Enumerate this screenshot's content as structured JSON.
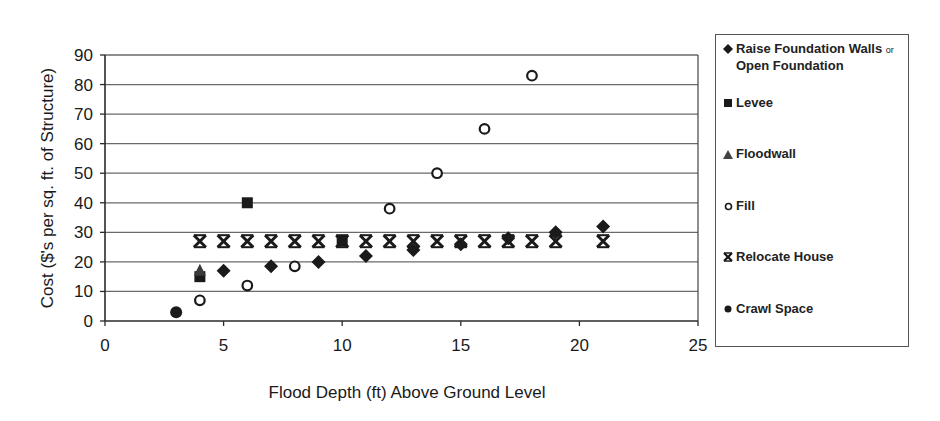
{
  "chart_data": {
    "type": "scatter",
    "title": "",
    "xlabel": "Flood Depth (ft) Above Ground Level",
    "ylabel": "Cost ($'s per sq. ft. of Structure)",
    "xlim": [
      0,
      25
    ],
    "ylim": [
      0,
      90
    ],
    "x_ticks": [
      0,
      5,
      10,
      15,
      20,
      25
    ],
    "y_ticks": [
      0,
      10,
      20,
      30,
      40,
      50,
      60,
      70,
      80,
      90
    ],
    "grid": {
      "horizontal": true,
      "vertical": false
    },
    "legend_position": "right",
    "series": [
      {
        "name": "Raise Foundation Walls or Open Foundation",
        "marker": "diamond",
        "points": [
          [
            5,
            17
          ],
          [
            7,
            18.5
          ],
          [
            9,
            20
          ],
          [
            11,
            22
          ],
          [
            13,
            24
          ],
          [
            15,
            26
          ],
          [
            17,
            28
          ],
          [
            19,
            30
          ],
          [
            21,
            32
          ]
        ]
      },
      {
        "name": "Levee",
        "marker": "square",
        "points": [
          [
            4,
            15
          ],
          [
            6,
            40
          ],
          [
            10,
            27
          ]
        ]
      },
      {
        "name": "Floodwall",
        "marker": "triangle",
        "points": [
          [
            4,
            17
          ]
        ]
      },
      {
        "name": "Fill",
        "marker": "open-circle",
        "points": [
          [
            4,
            7
          ],
          [
            6,
            12
          ],
          [
            8,
            18.5
          ],
          [
            12,
            38
          ],
          [
            14,
            50
          ],
          [
            16,
            65
          ],
          [
            18,
            83
          ]
        ]
      },
      {
        "name": "Relocate House",
        "marker": "x-bar",
        "points": [
          [
            4,
            27
          ],
          [
            5,
            27
          ],
          [
            6,
            27
          ],
          [
            7,
            27
          ],
          [
            8,
            27
          ],
          [
            9,
            27
          ],
          [
            10,
            27
          ],
          [
            11,
            27
          ],
          [
            12,
            27
          ],
          [
            13,
            27
          ],
          [
            14,
            27
          ],
          [
            15,
            27
          ],
          [
            16,
            27
          ],
          [
            17,
            27
          ],
          [
            18,
            27
          ],
          [
            19,
            27
          ],
          [
            21,
            27
          ]
        ]
      },
      {
        "name": "Crawl Space",
        "marker": "filled-circle",
        "points": [
          [
            3,
            3
          ]
        ]
      }
    ]
  },
  "legend": {
    "items": [
      {
        "label": "Raise Foundation Walls",
        "label_suffix": "or",
        "label_line2": "Open Foundation"
      },
      {
        "label": "Levee"
      },
      {
        "label": "Floodwall"
      },
      {
        "label": "Fill"
      },
      {
        "label": "Relocate House"
      },
      {
        "label": "Crawl Space"
      }
    ]
  }
}
